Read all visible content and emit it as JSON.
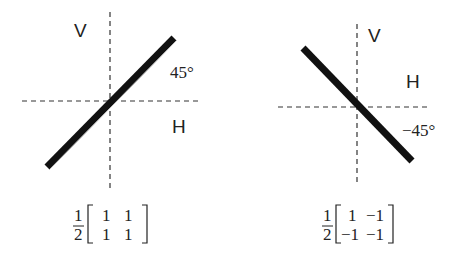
{
  "left": {
    "vertical_label": "V",
    "horizontal_label": "H",
    "angle_label": "45°",
    "matrix": {
      "prefactor_num": "1",
      "prefactor_den": "2",
      "rows": [
        [
          "1",
          "1"
        ],
        [
          "1",
          "1"
        ]
      ]
    }
  },
  "right": {
    "vertical_label": "V",
    "horizontal_label": "H",
    "angle_label": "−45°",
    "matrix": {
      "prefactor_num": "1",
      "prefactor_den": "2",
      "rows": [
        [
          "1",
          "−1"
        ],
        [
          "−1",
          "−1"
        ]
      ]
    }
  }
}
